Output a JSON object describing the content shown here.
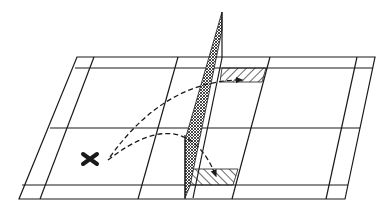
{
  "diagram": {
    "title": "Badminton court shot diagram",
    "colors": {
      "background": "#ffffff",
      "line": "#1a1a1a"
    },
    "elements": {
      "court": "court-outline",
      "net": "net",
      "player_marker": "X",
      "trajectories": [
        {
          "name": "shot-to-far-net-zone",
          "style": "dashed",
          "end": "arrow"
        },
        {
          "name": "shot-to-near-net-zone",
          "style": "dashed",
          "end": "arrow"
        }
      ],
      "target_zones": [
        {
          "name": "far-target-zone",
          "fill": "diagonal-hatch"
        },
        {
          "name": "near-target-zone",
          "fill": "diagonal-hatch"
        }
      ]
    }
  }
}
